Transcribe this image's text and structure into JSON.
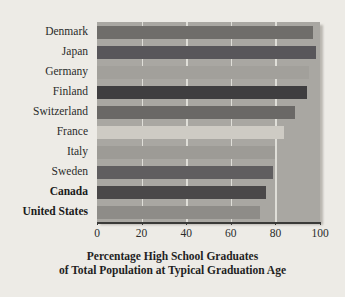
{
  "chart_data": {
    "type": "bar",
    "orientation": "horizontal",
    "title": "",
    "xlabel": "Percentage High School Graduates of Total Population at Typical Graduation Age",
    "xlabel_line1": "Percentage High School Graduates",
    "xlabel_line2": "of Total Population at Typical Graduation Age",
    "ylabel": "",
    "categories": [
      "Denmark",
      "Japan",
      "Germany",
      "Finland",
      "Switzerland",
      "France",
      "Italy",
      "Sweden",
      "Canada",
      "United States"
    ],
    "values": [
      97,
      98,
      95,
      94,
      89,
      84,
      80,
      79,
      76,
      73
    ],
    "xlim": [
      0,
      100
    ],
    "xticks": [
      0,
      20,
      40,
      60,
      80,
      100
    ],
    "xtick_labels": [
      "0",
      "20",
      "40",
      "60",
      "80",
      "100"
    ],
    "grid": true,
    "grid_color": "#e9e7e2",
    "legend": false,
    "plot_background": "#a9a7a2",
    "figure_background": "#edebe6",
    "bar_colors": [
      "#6f6d6a",
      "#58565a",
      "#a2a09b",
      "#3f3e40",
      "#6a6866",
      "#cecbc4",
      "#9d9b96",
      "#605e60",
      "#4a4849",
      "#8e8c88"
    ],
    "bold_categories": [
      "Canada",
      "United States"
    ]
  }
}
